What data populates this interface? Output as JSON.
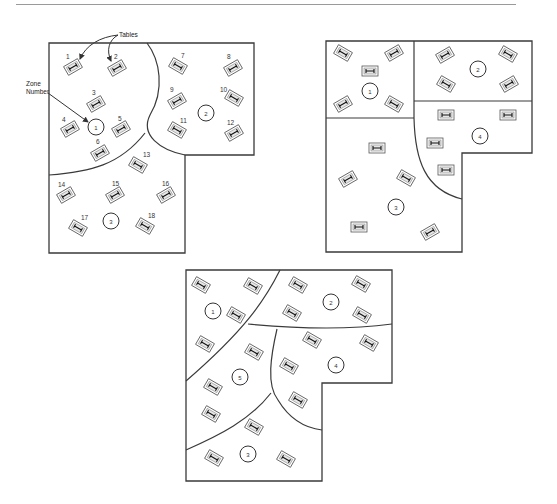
{
  "callouts": {
    "tables_label": "Tables",
    "zone_number_label_line1": "Zone",
    "zone_number_label_line2": "Number"
  },
  "layouts": [
    {
      "name": "layout-a-three-zones",
      "outline": "M49,43 L254,43 L254,155 L185,155 L185,253 L49,253 Z",
      "zone_lines": [
        "M147,43 C160,60 165,90 150,115 C140,135 160,150 185,155",
        "M49,175 C90,172 120,165 145,133"
      ],
      "zones": [
        {
          "label": "1",
          "x": 96,
          "y": 127
        },
        {
          "label": "2",
          "x": 206,
          "y": 113
        },
        {
          "label": "3",
          "x": 111,
          "y": 221
        }
      ],
      "tables": [
        {
          "num": "1",
          "x": 73,
          "y": 67,
          "rot": -30,
          "nx": -7,
          "ny": -8
        },
        {
          "num": "2",
          "x": 117,
          "y": 68,
          "rot": -30,
          "nx": -3,
          "ny": -9
        },
        {
          "num": "3",
          "x": 96,
          "y": 104,
          "rot": -30,
          "nx": -4,
          "ny": -9
        },
        {
          "num": "4",
          "x": 70,
          "y": 129,
          "rot": -30,
          "nx": -8,
          "ny": -7
        },
        {
          "num": "5",
          "x": 121,
          "y": 129,
          "rot": -30,
          "nx": -3,
          "ny": -8
        },
        {
          "num": "6",
          "x": 100,
          "y": 153,
          "rot": -30,
          "nx": -4,
          "ny": -9
        },
        {
          "num": "7",
          "x": 178,
          "y": 66,
          "rot": 30,
          "nx": 3,
          "ny": -8
        },
        {
          "num": "8",
          "x": 233,
          "y": 68,
          "rot": -30,
          "nx": -6,
          "ny": -9
        },
        {
          "num": "9",
          "x": 177,
          "y": 101,
          "rot": -30,
          "nx": -7,
          "ny": -9
        },
        {
          "num": "10",
          "x": 234,
          "y": 98,
          "rot": 30,
          "nx": -14,
          "ny": -6
        },
        {
          "num": "11",
          "x": 177,
          "y": 130,
          "rot": 30,
          "nx": 3,
          "ny": -7
        },
        {
          "num": "12",
          "x": 234,
          "y": 133,
          "rot": -30,
          "nx": -7,
          "ny": -8
        },
        {
          "num": "13",
          "x": 138,
          "y": 165,
          "rot": 30,
          "nx": 5,
          "ny": -8
        },
        {
          "num": "14",
          "x": 66,
          "y": 195,
          "rot": -30,
          "nx": -8,
          "ny": -8
        },
        {
          "num": "15",
          "x": 115,
          "y": 195,
          "rot": -30,
          "nx": -3,
          "ny": -9
        },
        {
          "num": "16",
          "x": 166,
          "y": 195,
          "rot": -30,
          "nx": -4,
          "ny": -9
        },
        {
          "num": "17",
          "x": 78,
          "y": 228,
          "rot": 30,
          "nx": 3,
          "ny": -8
        },
        {
          "num": "18",
          "x": 145,
          "y": 226,
          "rot": 30,
          "nx": 3,
          "ny": -8
        }
      ]
    },
    {
      "name": "layout-b-four-zones",
      "outline": "M326,41 L532,41 L532,153 L462,153 L462,252 L326,252 Z",
      "zone_lines": [
        "M326,118 L414,118",
        "M414,41 L414,118",
        "M414,101 L532,101",
        "M414,118 C415,160 425,190 462,199"
      ],
      "zones": [
        {
          "label": "1",
          "x": 370,
          "y": 91
        },
        {
          "label": "2",
          "x": 478,
          "y": 69
        },
        {
          "label": "3",
          "x": 396,
          "y": 207
        },
        {
          "label": "4",
          "x": 480,
          "y": 136
        }
      ],
      "tables": [
        {
          "x": 343,
          "y": 53,
          "rot": 30
        },
        {
          "x": 394,
          "y": 53,
          "rot": -30
        },
        {
          "x": 370,
          "y": 71,
          "rot": 0
        },
        {
          "x": 343,
          "y": 104,
          "rot": -30
        },
        {
          "x": 394,
          "y": 104,
          "rot": 30
        },
        {
          "x": 445,
          "y": 55,
          "rot": -30
        },
        {
          "x": 508,
          "y": 54,
          "rot": 30
        },
        {
          "x": 446,
          "y": 84,
          "rot": 30
        },
        {
          "x": 509,
          "y": 84,
          "rot": -30
        },
        {
          "x": 446,
          "y": 115,
          "rot": 0
        },
        {
          "x": 508,
          "y": 115,
          "rot": 0
        },
        {
          "x": 435,
          "y": 143,
          "rot": 0
        },
        {
          "x": 446,
          "y": 170,
          "rot": 0
        },
        {
          "x": 377,
          "y": 148,
          "rot": 0
        },
        {
          "x": 348,
          "y": 179,
          "rot": -30
        },
        {
          "x": 406,
          "y": 178,
          "rot": 30
        },
        {
          "x": 359,
          "y": 227,
          "rot": 0
        },
        {
          "x": 430,
          "y": 232,
          "rot": -30
        }
      ]
    },
    {
      "name": "layout-c-five-zones",
      "outline": "M186,270 L392,270 L392,383 L322,383 L322,481 L186,481 Z",
      "zone_lines": [
        "M280,270 C265,300 245,330 186,381",
        "M248,324 C290,328 340,331 392,324",
        "M277,329 C271,355 266,385 278,400 C290,420 305,428 322,430",
        "M186,450 C220,435 250,420 271,393"
      ],
      "zones": [
        {
          "label": "1",
          "x": 213,
          "y": 311
        },
        {
          "label": "2",
          "x": 331,
          "y": 302
        },
        {
          "label": "3",
          "x": 248,
          "y": 454
        },
        {
          "label": "4",
          "x": 336,
          "y": 365
        },
        {
          "label": "5",
          "x": 240,
          "y": 377
        }
      ],
      "tables": [
        {
          "x": 201,
          "y": 285,
          "rot": 30
        },
        {
          "x": 253,
          "y": 286,
          "rot": 30
        },
        {
          "x": 236,
          "y": 315,
          "rot": 30
        },
        {
          "x": 205,
          "y": 344,
          "rot": 30
        },
        {
          "x": 254,
          "y": 352,
          "rot": 30
        },
        {
          "x": 298,
          "y": 285,
          "rot": 30
        },
        {
          "x": 361,
          "y": 284,
          "rot": 30
        },
        {
          "x": 292,
          "y": 313,
          "rot": 30
        },
        {
          "x": 362,
          "y": 315,
          "rot": 30
        },
        {
          "x": 312,
          "y": 340,
          "rot": 30
        },
        {
          "x": 369,
          "y": 343,
          "rot": 30
        },
        {
          "x": 289,
          "y": 366,
          "rot": 30
        },
        {
          "x": 298,
          "y": 400,
          "rot": 30
        },
        {
          "x": 213,
          "y": 387,
          "rot": 30
        },
        {
          "x": 211,
          "y": 414,
          "rot": 30
        },
        {
          "x": 254,
          "y": 427,
          "rot": 30
        },
        {
          "x": 214,
          "y": 458,
          "rot": 30
        },
        {
          "x": 286,
          "y": 459,
          "rot": 30
        }
      ]
    }
  ]
}
